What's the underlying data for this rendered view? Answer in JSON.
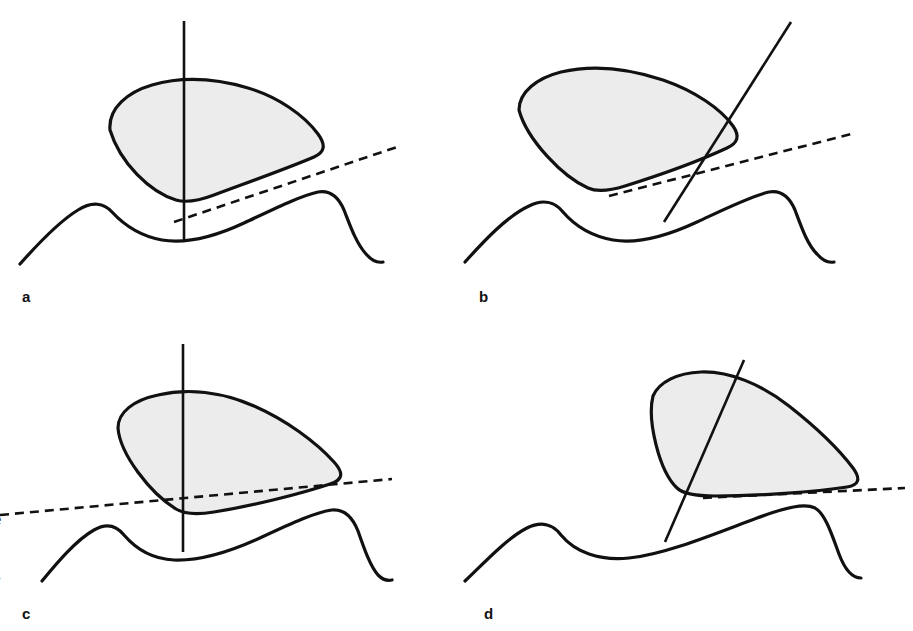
{
  "figure": {
    "kind": "four-panel-line-diagram",
    "background_color": "#ffffff",
    "width": 913,
    "height": 631,
    "outline_color": "#111111",
    "fill_color": "#ececec",
    "line_color": "#111111"
  },
  "panels": [
    {
      "id": "a",
      "label": "a",
      "axis_type": "vertical",
      "tangent_type": "dashed-oblique"
    },
    {
      "id": "b",
      "label": "b",
      "axis_type": "oblique",
      "tangent_type": "dashed-oblique"
    },
    {
      "id": "c",
      "label": "c",
      "axis_type": "vertical",
      "tangent_type": "dashed-shallow"
    },
    {
      "id": "d",
      "label": "d",
      "axis_type": "oblique",
      "tangent_type": "dashed-horizontal"
    }
  ],
  "margin_text": {
    "scrap_letter": "e",
    "scrap_hyphen": "-"
  }
}
